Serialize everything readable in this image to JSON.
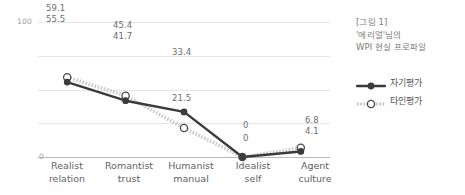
{
  "caption": {
    "line1": "[그림 1]",
    "line2": "'에리얼'님의",
    "line3": "WPI 현실 프로파일"
  },
  "legend": {
    "items": [
      {
        "label": "자기평가",
        "marker": "filled-circle-solid-line",
        "color": "#3b3b3b"
      },
      {
        "label": "타인평가",
        "marker": "open-circle-dotted-line",
        "color": "#c9c9c9"
      }
    ]
  },
  "axis": {
    "y_top_label": "100",
    "y_zero_label": "0"
  },
  "chart_data": {
    "type": "line",
    "title": "WPI 현실 프로파일",
    "categories": [
      "Realist relation",
      "Romantist trust",
      "Humanist manual",
      "Idealist self",
      "Agent culture"
    ],
    "category_lines": [
      [
        "Realist",
        "relation"
      ],
      [
        "Romantist",
        "trust"
      ],
      [
        "Humanist",
        "manual"
      ],
      [
        "Idealist",
        "self"
      ],
      [
        "Agent",
        "culture"
      ]
    ],
    "series": [
      {
        "name": "자기평가",
        "values": [
          55.5,
          41.7,
          33.4,
          0,
          4.1
        ],
        "color": "#3b3b3b",
        "line_style": "solid",
        "marker": "filled-circle"
      },
      {
        "name": "타인평가",
        "values": [
          59.1,
          45.4,
          21.5,
          0,
          6.8
        ],
        "color": "#c9c9c9",
        "line_style": "dotted",
        "marker": "open-circle"
      }
    ],
    "ylim": [
      0,
      100
    ],
    "ytick_labels": [
      "0",
      "100"
    ],
    "gridlines": [
      0,
      25,
      50,
      75,
      100
    ],
    "grid": true,
    "xlabel": "",
    "ylabel": "",
    "legend_position": "right"
  },
  "labels": {
    "p0_other": "59.1",
    "p0_self": "55.5",
    "p1_other": "45.4",
    "p1_self": "41.7",
    "p2_self": "33.4",
    "p2_other": "21.5",
    "p3_other": "0",
    "p3_self": "0",
    "p4_other": "6.8",
    "p4_self": "4.1"
  }
}
